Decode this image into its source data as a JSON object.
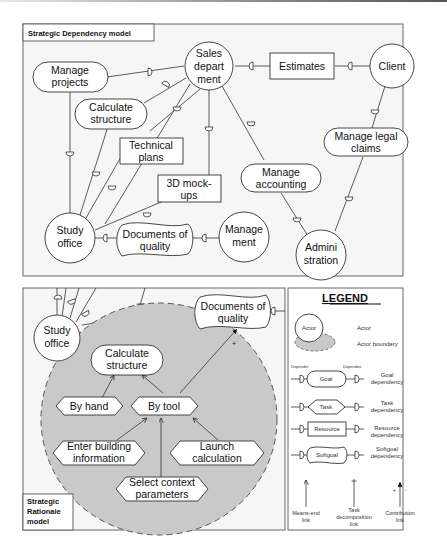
{
  "sd_model": {
    "title": "Strategic Dependency model",
    "actors": {
      "sales": [
        "Sales",
        "depart",
        "ment"
      ],
      "client": [
        "Client"
      ],
      "study": [
        "Study",
        "office"
      ],
      "management": [
        "Manage",
        "ment"
      ],
      "administration": [
        "Admini",
        "stration"
      ]
    },
    "goals": {
      "manage_projects": [
        "Manage",
        "projects"
      ],
      "calculate_structure": [
        "Calculate",
        "structure"
      ],
      "manage_accounting": [
        "Manage",
        "accounting"
      ],
      "manage_legal": [
        "Manage legal",
        "claims"
      ]
    },
    "resources": {
      "estimates": [
        "Estimates"
      ],
      "technical_plans": [
        "Technical",
        "plans"
      ],
      "mockups": [
        "3D mock-",
        "ups"
      ]
    },
    "softgoals": {
      "documents_quality": [
        "Documents of",
        "quality"
      ]
    }
  },
  "sr_model": {
    "title": [
      "Strategic",
      "Rationale",
      "model"
    ],
    "actor": [
      "Study",
      "office"
    ],
    "softgoal": [
      "Documents of",
      "quality"
    ],
    "goal": [
      "Calculate",
      "structure"
    ],
    "tasks": {
      "by_hand": [
        "By hand"
      ],
      "by_tool": [
        "By tool"
      ],
      "enter_building": [
        "Enter building",
        "information"
      ],
      "launch_calc": [
        "Launch",
        "calculation"
      ],
      "select_context": [
        "Select context",
        "parameters"
      ]
    },
    "contribution_sign": "+"
  },
  "legend": {
    "title": "LEGEND",
    "actor_node": "Actor",
    "actor_label": "Actor",
    "boundary_label": "Actor boundary",
    "depender": "Depender",
    "dependee": "Dependee",
    "goal_node": "Goal",
    "goal_label": [
      "Goal",
      "dependency"
    ],
    "task_node": "Task",
    "task_label": [
      "Task",
      "dependency"
    ],
    "resource_node": "Resource",
    "resource_label": [
      "Resource",
      "dependency"
    ],
    "softgoal_node": "Softgoal",
    "softgoal_label": [
      "Softgoal",
      "dependency"
    ],
    "means_end": [
      "Means-end",
      "link"
    ],
    "task_decomp": [
      "Task",
      "decomposition",
      "link"
    ],
    "contribution": [
      "Contribution",
      "link"
    ],
    "plus": "+",
    "minus": "-"
  }
}
